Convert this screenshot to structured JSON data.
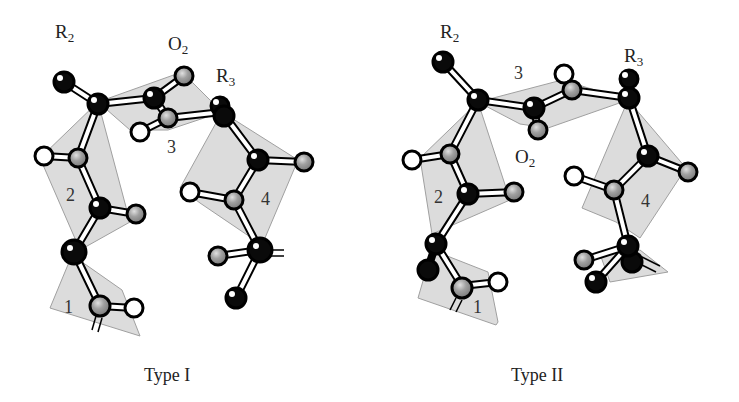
{
  "figure": {
    "panels": [
      {
        "caption": "Type I",
        "labels": {
          "r2": {
            "main": "R",
            "sub": "2"
          },
          "o2": {
            "main": "O",
            "sub": "2"
          },
          "r3": {
            "main": "R",
            "sub": "3"
          }
        },
        "residue_numbers": [
          "1",
          "2",
          "3",
          "4"
        ]
      },
      {
        "caption": "Type II",
        "labels": {
          "r2": {
            "main": "R",
            "sub": "2"
          },
          "o2": {
            "main": "O",
            "sub": "2"
          },
          "r3": {
            "main": "R",
            "sub": "3"
          }
        },
        "residue_numbers": [
          "1",
          "2",
          "3",
          "4"
        ]
      }
    ],
    "colors": {
      "plane_fill": "#d9d9d9",
      "plane_edge": "#9a9a9a",
      "atom_black": "#0a0a0a",
      "atom_grey": "#9c9c9c",
      "atom_white": "#ffffff",
      "bond_fill": "#ffffff",
      "bond_edge": "#000000"
    }
  }
}
